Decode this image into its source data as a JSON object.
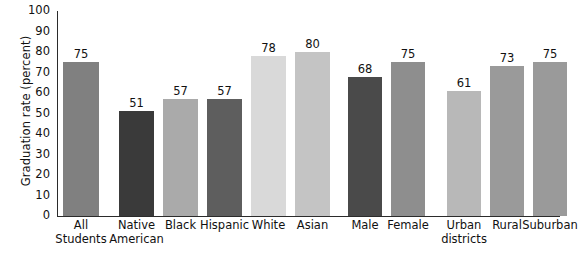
{
  "chart_data": {
    "type": "bar",
    "title": "",
    "xlabel": "",
    "ylabel": "Graduation rate (percent)",
    "ylim": [
      0,
      100
    ],
    "ytick_step": 10,
    "yticks": [
      "100",
      "90",
      "80",
      "70",
      "60",
      "50",
      "40",
      "30",
      "20",
      "10",
      "0"
    ],
    "grid": false,
    "legend": "none",
    "categories": [
      "All Students",
      "Native American",
      "Black",
      "Hispanic",
      "White",
      "Asian",
      "Male",
      "Female",
      "Urban districts",
      "Rural",
      "Suburban"
    ],
    "values": [
      75,
      51,
      57,
      57,
      78,
      80,
      68,
      75,
      61,
      73,
      75
    ],
    "bars": [
      {
        "label_lines": [
          "All",
          "Students"
        ],
        "value": 75,
        "color": "#808080",
        "x": 6,
        "width": 36,
        "group": "overall"
      },
      {
        "label_lines": [
          "Native",
          "American"
        ],
        "value": 51,
        "color": "#3a3a3a",
        "x": 62,
        "width": 35,
        "group": "race"
      },
      {
        "label_lines": [
          "Black"
        ],
        "value": 57,
        "color": "#aaaaaa",
        "x": 106,
        "width": 35,
        "group": "race"
      },
      {
        "label_lines": [
          "Hispanic"
        ],
        "value": 57,
        "color": "#5e5e5e",
        "x": 150,
        "width": 35,
        "group": "race"
      },
      {
        "label_lines": [
          "White"
        ],
        "value": 78,
        "color": "#d9d9d9",
        "x": 194,
        "width": 35,
        "group": "race"
      },
      {
        "label_lines": [
          "Asian"
        ],
        "value": 80,
        "color": "#c4c4c4",
        "x": 238,
        "width": 35,
        "group": "race"
      },
      {
        "label_lines": [
          "Male"
        ],
        "value": 68,
        "color": "#4a4a4a",
        "x": 291,
        "width": 34,
        "group": "gender"
      },
      {
        "label_lines": [
          "Female"
        ],
        "value": 75,
        "color": "#8e8e8e",
        "x": 334,
        "width": 34,
        "group": "gender"
      },
      {
        "label_lines": [
          "Urban",
          "districts"
        ],
        "value": 61,
        "color": "#b8b8b8",
        "x": 390,
        "width": 34,
        "group": "locale"
      },
      {
        "label_lines": [
          "Rural"
        ],
        "value": 73,
        "color": "#9a9a9a",
        "x": 433,
        "width": 34,
        "group": "locale"
      },
      {
        "label_lines": [
          "Suburban"
        ],
        "value": 75,
        "color": "#9a9a9a",
        "x": 476,
        "width": 34,
        "group": "locale"
      }
    ]
  }
}
